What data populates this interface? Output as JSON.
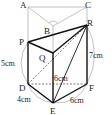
{
  "diagram": {
    "vertices": {
      "A": "A",
      "B": "B",
      "C": "C",
      "P": "P",
      "Q": "Q",
      "R": "R",
      "D": "D",
      "E": "E",
      "F": "F"
    },
    "measures": {
      "PD": "5cm",
      "QE": "6cm",
      "RF": "7cm",
      "DE": "4cm",
      "EF": "6cm"
    }
  }
}
